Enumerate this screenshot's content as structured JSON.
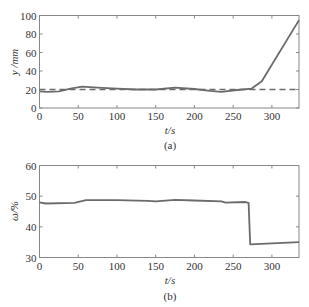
{
  "chart_data": [
    {
      "type": "line",
      "panel": "(a)",
      "caption": "(a)",
      "xlabel": "t/s",
      "ylabel": "y /mm",
      "xlim": [
        0,
        335
      ],
      "ylim": [
        0,
        100
      ],
      "xticks": [
        0,
        50,
        100,
        150,
        200,
        250,
        300
      ],
      "yticks": [
        0,
        20,
        40,
        60,
        80,
        100
      ],
      "grid": false,
      "series": [
        {
          "name": "actual",
          "style": "solid",
          "color": "#6b6b6b",
          "x": [
            0,
            10,
            25,
            40,
            55,
            75,
            100,
            125,
            150,
            175,
            200,
            220,
            235,
            255,
            274,
            287,
            335
          ],
          "y": [
            18,
            17.5,
            18,
            21,
            23,
            22,
            21,
            20,
            20,
            22,
            20.5,
            18.5,
            17.5,
            19.5,
            21,
            29,
            95
          ]
        },
        {
          "name": "target",
          "style": "dashed",
          "color": "#6b6b6b",
          "x": [
            0,
            335
          ],
          "y": [
            20,
            20
          ]
        }
      ]
    },
    {
      "type": "line",
      "panel": "(b)",
      "caption": "(b)",
      "xlabel": "t/s",
      "ylabel": "ω/%",
      "xlim": [
        0,
        335
      ],
      "ylim": [
        30,
        60
      ],
      "xticks": [
        0,
        50,
        100,
        150,
        200,
        250,
        300
      ],
      "yticks": [
        30,
        40,
        50,
        60
      ],
      "grid": false,
      "series": [
        {
          "name": "moisture",
          "style": "solid",
          "color": "#6b6b6b",
          "x": [
            0,
            8,
            45,
            60,
            100,
            140,
            150,
            175,
            200,
            235,
            240,
            265,
            270,
            272,
            335
          ],
          "y": [
            48,
            47.6,
            47.8,
            48.7,
            48.7,
            48.5,
            48.3,
            48.8,
            48.6,
            48.3,
            47.9,
            48.1,
            47.8,
            34.3,
            35
          ]
        }
      ]
    }
  ]
}
